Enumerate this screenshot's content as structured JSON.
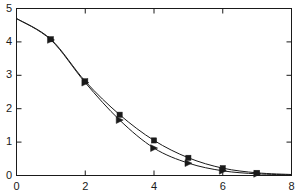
{
  "chart_data": {
    "type": "line",
    "title": "",
    "subtitle": "",
    "xlabel": "",
    "ylabel": "",
    "xlim": [
      0,
      8
    ],
    "ylim": [
      0,
      5
    ],
    "xticks": [
      0,
      2,
      4,
      6,
      8
    ],
    "yticks": [
      0,
      1,
      2,
      3,
      4,
      5
    ],
    "xtick_labels": [
      "0",
      "2",
      "4",
      "6",
      "8"
    ],
    "ytick_labels": [
      "0",
      "1",
      "2",
      "3",
      "4",
      "5"
    ],
    "grid": false,
    "legend": "none",
    "frame": "box",
    "tick_direction": "in",
    "line_color": "#1a1a1a",
    "series": [
      {
        "name": "series-1",
        "marker": "square",
        "x": [
          0,
          1,
          2,
          3,
          4,
          5,
          6,
          7,
          8
        ],
        "values": [
          4.7,
          4.08,
          2.82,
          1.82,
          1.05,
          0.53,
          0.22,
          0.08,
          0.03
        ]
      },
      {
        "name": "series-2",
        "marker": "triangle-right",
        "x": [
          0,
          1,
          2,
          3,
          4,
          5,
          6,
          7,
          8
        ],
        "values": [
          4.7,
          4.06,
          2.78,
          1.66,
          0.82,
          0.37,
          0.14,
          0.05,
          0.02
        ]
      }
    ]
  },
  "axes": {
    "y_labels": [
      {
        "text": "5",
        "value": 5
      },
      {
        "text": "4",
        "value": 4
      },
      {
        "text": "3",
        "value": 3
      },
      {
        "text": "2",
        "value": 2
      },
      {
        "text": "1",
        "value": 1
      },
      {
        "text": "0",
        "value": 0
      }
    ],
    "x_labels": [
      {
        "text": "0",
        "value": 0
      },
      {
        "text": "2",
        "value": 2
      },
      {
        "text": "4",
        "value": 4
      },
      {
        "text": "6",
        "value": 6
      },
      {
        "text": "8",
        "value": 8
      }
    ]
  }
}
